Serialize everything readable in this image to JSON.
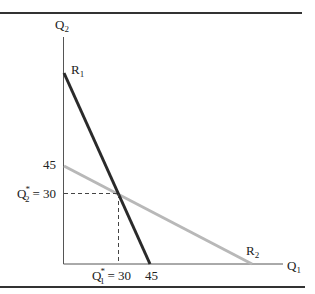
{
  "diagram": {
    "type": "reaction-curves",
    "axes": {
      "y_label": "Q",
      "y_label_sub": "2",
      "x_label": "Q",
      "x_label_sub": "1"
    },
    "curves": [
      {
        "name": "R",
        "sub": "1",
        "color": "#2a2a2a",
        "from": [
          0,
          90
        ],
        "to": [
          45,
          0
        ],
        "label_at": "top"
      },
      {
        "name": "R",
        "sub": "2",
        "color": "#b8b8b8",
        "from": [
          0,
          45
        ],
        "to": [
          90,
          0
        ],
        "label_at": "right"
      }
    ],
    "ticks": {
      "y_45": "45",
      "x_45": "45"
    },
    "equilibrium": {
      "q1_label": "Q",
      "q1_sub": "1",
      "q1_star": "*",
      "q1_value": "= 30",
      "q2_label": "Q",
      "q2_sub": "2",
      "q2_star": "*",
      "q2_value": "= 30",
      "point": [
        30,
        30
      ]
    },
    "colors": {
      "rule": "#333333",
      "axis": "#555555",
      "r1": "#2a2a2a",
      "r2": "#b8b8b8",
      "dashed": "#444444"
    }
  }
}
